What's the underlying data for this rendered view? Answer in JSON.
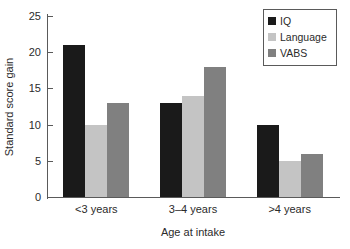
{
  "chart_data": {
    "type": "bar",
    "title": "",
    "subtitle": "",
    "xlabel": "Age at intake",
    "ylabel": "Standard score gain",
    "categories": [
      "<3 years",
      "3–4 years",
      ">4 years"
    ],
    "series": [
      {
        "name": "IQ",
        "values": [
          21,
          13,
          10
        ],
        "color": "#1a1a1a"
      },
      {
        "name": "Language",
        "values": [
          10,
          14,
          5
        ],
        "color": "#c4c4c4"
      },
      {
        "name": "VABS",
        "values": [
          13,
          18,
          6
        ],
        "color": "#808080"
      }
    ],
    "ylim": [
      0,
      25
    ],
    "ytick_values": [
      0,
      5,
      10,
      15,
      20,
      25
    ],
    "ytick_labels": [
      "0",
      "5",
      "10",
      "15",
      "20",
      "25"
    ],
    "grid": false,
    "legend_position": "top-right",
    "axis_color": "#5a5a5a",
    "text_color": "#2b2b2b",
    "background": "#ffffff"
  },
  "legend": {
    "entries": [
      {
        "label": "IQ",
        "color": "#1a1a1a"
      },
      {
        "label": "Language",
        "color": "#c4c4c4"
      },
      {
        "label": "VABS",
        "color": "#808080"
      }
    ]
  }
}
